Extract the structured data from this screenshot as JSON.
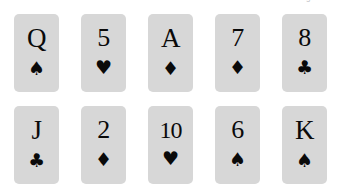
{
  "page": {
    "background_color": "#ffffff",
    "top_clipped_text": "ring stimulus"
  },
  "card_grid": {
    "columns": 5,
    "rows": 2,
    "card_face_color": "#d7d7d7",
    "ink_color": "#0a0a0a",
    "suit_glyphs": {
      "spade": "♠",
      "heart": "♥",
      "diamond": "♦",
      "club": "♣"
    },
    "rows_data": [
      {
        "row_index": 0,
        "cards": [
          {
            "rank": "Q",
            "suit": "spade",
            "suit_glyph": "♠",
            "label": "Q of spades"
          },
          {
            "rank": "5",
            "suit": "heart",
            "suit_glyph": "♥",
            "label": "5 of hearts"
          },
          {
            "rank": "A",
            "suit": "diamond",
            "suit_glyph": "♦",
            "label": "A of diamonds"
          },
          {
            "rank": "7",
            "suit": "diamond",
            "suit_glyph": "♦",
            "label": "7 of diamonds"
          },
          {
            "rank": "8",
            "suit": "club",
            "suit_glyph": "♣",
            "label": "8 of clubs"
          }
        ]
      },
      {
        "row_index": 1,
        "cards": [
          {
            "rank": "J",
            "suit": "club",
            "suit_glyph": "♣",
            "label": "J of clubs"
          },
          {
            "rank": "2",
            "suit": "diamond",
            "suit_glyph": "♦",
            "label": "2 of diamonds"
          },
          {
            "rank": "10",
            "suit": "heart",
            "suit_glyph": "♥",
            "label": "10 of hearts"
          },
          {
            "rank": "6",
            "suit": "spade",
            "suit_glyph": "♠",
            "label": "6 of spades"
          },
          {
            "rank": "K",
            "suit": "spade",
            "suit_glyph": "♠",
            "label": "K of spades"
          }
        ]
      }
    ]
  }
}
